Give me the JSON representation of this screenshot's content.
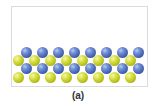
{
  "figure": {
    "caption": "(a)",
    "colors": {
      "blue_atom": "#4a68b8",
      "yellow_atom": "#c8ce2a",
      "frame_border": "#d9dcdc"
    },
    "lattice": {
      "rows": [
        {
          "type": "blue",
          "y": 47,
          "xs": [
            21,
            37,
            53,
            69,
            85,
            101,
            117,
            133
          ]
        },
        {
          "type": "yellow",
          "y": 55,
          "xs": [
            13,
            29,
            45,
            61,
            77,
            93,
            109,
            125
          ]
        },
        {
          "type": "blue",
          "y": 63,
          "xs": [
            21,
            37,
            53,
            69,
            85,
            101,
            117,
            133
          ]
        },
        {
          "type": "yellow",
          "y": 72,
          "xs": [
            13,
            29,
            45,
            61,
            77,
            93,
            109,
            125
          ]
        }
      ]
    }
  }
}
